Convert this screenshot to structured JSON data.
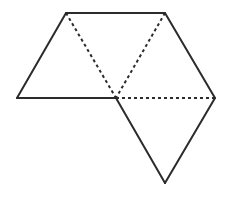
{
  "diagram": {
    "title": "",
    "colors": {
      "background": "#ffffff",
      "stroke": "#2b2b2b"
    },
    "vertices": {
      "top_left": [
        66,
        13
      ],
      "top_right": [
        165,
        13
      ],
      "left": [
        17,
        98
      ],
      "center": [
        116,
        98
      ],
      "right": [
        215,
        98
      ],
      "bottom": [
        165,
        183
      ]
    },
    "solid_edges": [
      [
        "top_left",
        "top_right"
      ],
      [
        "top_right",
        "right"
      ],
      [
        "right",
        "bottom"
      ],
      [
        "bottom",
        "center"
      ],
      [
        "center",
        "left"
      ],
      [
        "left",
        "top_left"
      ]
    ],
    "dashed_edges": [
      [
        "top_left",
        "center"
      ],
      [
        "top_right",
        "center"
      ],
      [
        "center",
        "right"
      ]
    ],
    "triangles": [
      [
        "left",
        "top_left",
        "center"
      ],
      [
        "top_left",
        "top_right",
        "center"
      ],
      [
        "top_right",
        "right",
        "center"
      ],
      [
        "center",
        "right",
        "bottom"
      ]
    ]
  }
}
